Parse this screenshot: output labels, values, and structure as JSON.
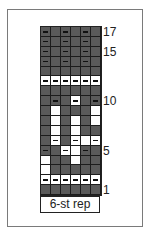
{
  "title_cutoff": "",
  "chart": {
    "columns": 6,
    "rows_top_to_bottom": [
      {
        "row": 17,
        "cells": [
          "D-",
          "D",
          "D-",
          "D",
          "D-",
          "D"
        ]
      },
      {
        "row": 16,
        "cells": [
          "D-",
          "D",
          "D-",
          "D",
          "D-",
          "D"
        ]
      },
      {
        "row": 15,
        "cells": [
          "D-",
          "D",
          "D-",
          "D",
          "D-",
          "D"
        ]
      },
      {
        "row": 14,
        "cells": [
          "D-",
          "D",
          "D-",
          "D",
          "D-",
          "D"
        ]
      },
      {
        "row": 13,
        "cells": [
          "D",
          "D",
          "D",
          "D",
          "D",
          "D"
        ]
      },
      {
        "row": 12,
        "cells": [
          "W-",
          "W-",
          "W-",
          "W-",
          "W-",
          "W-"
        ]
      },
      {
        "row": 11,
        "cells": [
          "D",
          "D",
          "D",
          "D",
          "D",
          "D"
        ]
      },
      {
        "row": 10,
        "cells": [
          "D",
          "D-",
          "D",
          "W-",
          "D",
          "D-"
        ]
      },
      {
        "row": 9,
        "cells": [
          "D",
          "W",
          "D",
          "D",
          "D",
          "W"
        ]
      },
      {
        "row": 8,
        "cells": [
          "D",
          "W",
          "D",
          "W",
          "D",
          "W"
        ]
      },
      {
        "row": 7,
        "cells": [
          "D",
          "W",
          "D",
          "W",
          "D",
          "D"
        ]
      },
      {
        "row": 6,
        "cells": [
          "D",
          "W-",
          "D",
          "W-",
          "W",
          "W-"
        ]
      },
      {
        "row": 5,
        "cells": [
          "D-",
          "D",
          "W-",
          "W",
          "D-",
          "D"
        ]
      },
      {
        "row": 4,
        "cells": [
          "W",
          "D",
          "D",
          "W",
          "D",
          "D"
        ]
      },
      {
        "row": 3,
        "cells": [
          "W",
          "D",
          "D",
          "D",
          "D",
          "D"
        ]
      },
      {
        "row": 2,
        "cells": [
          "W-",
          "W-",
          "W-",
          "W-",
          "W-",
          "W-"
        ]
      },
      {
        "row": 1,
        "cells": [
          "D",
          "D",
          "D",
          "D",
          "D",
          "D"
        ]
      }
    ],
    "legend_key": {
      "D": "dark color (knit)",
      "W": "light color (knit)",
      "-": "purl"
    },
    "colors": {
      "dark": "#5a5a5a",
      "light": "#ffffff",
      "grid": "#1c1c1c"
    }
  },
  "row_labels": [
    {
      "text": "17",
      "row": 17
    },
    {
      "text": "15",
      "row": 15
    },
    {
      "text": "10",
      "row": 10
    },
    {
      "text": "5",
      "row": 5
    },
    {
      "text": "1",
      "row": 1
    }
  ],
  "repeat_label": "6-st rep"
}
